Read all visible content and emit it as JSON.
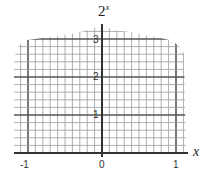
{
  "chart_data": {
    "type": "line",
    "title_base": "2",
    "title_exponent": "x",
    "xlabel": "x",
    "ylabel": "2^x",
    "x_ticks": [
      "-1",
      "0",
      "1"
    ],
    "y_ticks": [
      "1",
      "2",
      "3"
    ],
    "xlim": [
      -1.1,
      1.1
    ],
    "ylim": [
      0,
      3.2
    ],
    "grid": true,
    "grid_minor_x_step": 0.1,
    "grid_minor_y_step": 0.2,
    "series": [],
    "note": "Blank graph paper grid for plotting 2^x; no curve drawn"
  },
  "labels": {
    "title_base": "2",
    "title_exp": "x",
    "x_axis": "x",
    "x_tick_neg1": "-1",
    "x_tick_0": "0",
    "x_tick_1": "1",
    "y_tick_1": "1",
    "y_tick_2": "2",
    "y_tick_3": "3"
  },
  "colors": {
    "grid_minor": "#9a9a9a",
    "grid_major": "#555555",
    "axis": "#333333"
  }
}
